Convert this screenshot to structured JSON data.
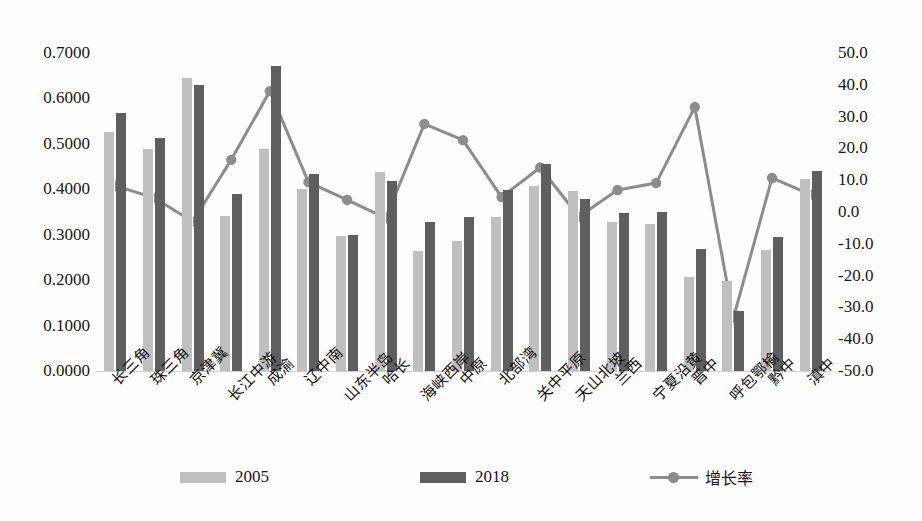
{
  "chart_data": {
    "type": "bar",
    "title": "",
    "subtitle": "",
    "xlabel": "",
    "ylabel": "",
    "y2label": "",
    "grid": false,
    "legend_position": "bottom",
    "categories": [
      "长三角",
      "珠三角",
      "京津冀",
      "长江中游",
      "成渝",
      "辽中南",
      "山东半岛",
      "哈长",
      "海峡西岸",
      "中原",
      "北部湾",
      "关中平原",
      "天山北坡",
      "兰西",
      "宁夏沿黄",
      "晋中",
      "呼包鄂榆",
      "黔中",
      "滇中"
    ],
    "series": [
      {
        "name": "2005",
        "type": "bar",
        "axis": "left",
        "color": "#bfbfbf",
        "values": [
          0.526,
          0.489,
          0.646,
          0.341,
          0.489,
          0.401,
          0.297,
          0.438,
          0.264,
          0.286,
          0.338,
          0.408,
          0.397,
          0.328,
          0.324,
          0.207,
          0.198,
          0.266,
          0.423
        ]
      },
      {
        "name": "2018",
        "type": "bar",
        "axis": "left",
        "color": "#5f5f5f",
        "values": [
          0.568,
          0.512,
          0.63,
          0.39,
          0.672,
          0.434,
          0.3,
          0.419,
          0.329,
          0.339,
          0.399,
          0.456,
          0.378,
          0.348,
          0.349,
          0.269,
          0.132,
          0.295,
          0.441
        ]
      },
      {
        "name": "增长率",
        "type": "line",
        "axis": "right",
        "color": "#8c8c8c",
        "values": [
          8.2,
          4.5,
          -3.0,
          16.4,
          38.0,
          9.4,
          3.8,
          -1.9,
          27.7,
          22.6,
          4.7,
          14.0,
          -1.5,
          6.9,
          9.1,
          33.0,
          -33.3,
          10.7,
          5.5
        ]
      }
    ],
    "ylim": [
      0.0,
      0.7
    ],
    "y2lim": [
      -50.0,
      50.0
    ],
    "yticks": [
      "0.0000",
      "0.1000",
      "0.2000",
      "0.3000",
      "0.4000",
      "0.5000",
      "0.6000",
      "0.7000"
    ],
    "ytick_values": [
      0.0,
      0.1,
      0.2,
      0.3,
      0.4,
      0.5,
      0.6,
      0.7
    ],
    "y2ticks": [
      "-50.0",
      "-40.0",
      "-30.0",
      "-20.0",
      "-10.0",
      "0.0",
      "10.0",
      "20.0",
      "30.0",
      "40.0",
      "50.0"
    ],
    "y2tick_values": [
      -50,
      -40,
      -30,
      -20,
      -10,
      0,
      10,
      20,
      30,
      40,
      50
    ]
  },
  "legend": {
    "items": [
      {
        "label": "2005",
        "marker": "bar-swatch-light"
      },
      {
        "label": "2018",
        "marker": "bar-swatch-dark"
      },
      {
        "label": "增长率",
        "marker": "line-marker"
      }
    ]
  }
}
